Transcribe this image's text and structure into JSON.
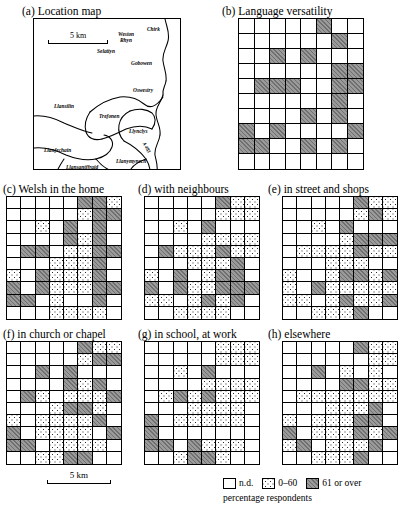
{
  "figure": {
    "scale_bar_label": "5 km",
    "bottom_scale_label": "5 km"
  },
  "legend": {
    "caption": "percentage respondents",
    "items": [
      {
        "key": "nd",
        "label": "n.d.",
        "fill": "white",
        "color": "#ffffff"
      },
      {
        "key": "low",
        "label": "0–60",
        "fill": "dotted",
        "color": "#ffffff"
      },
      {
        "key": "high",
        "label": "61 or over",
        "fill": "gray",
        "color": "#9a9a9a"
      }
    ]
  },
  "location_map": {
    "title": "(a) Location map",
    "scale_label": "5 km",
    "places": [
      {
        "name": "Chirk",
        "x": 137,
        "y": 14
      },
      {
        "name": "Weston",
        "x": 114,
        "y": 18
      },
      {
        "name": "Rhyn",
        "x": 117,
        "y": 24
      },
      {
        "name": "Selattyn",
        "x": 96,
        "y": 41
      },
      {
        "name": "Gobowen",
        "x": 126,
        "y": 52
      },
      {
        "name": "Oswestry",
        "x": 128,
        "y": 80
      },
      {
        "name": "Llansilin",
        "x": 49,
        "y": 90
      },
      {
        "name": "Trefonen",
        "x": 92,
        "y": 98
      },
      {
        "name": "Llynclys",
        "x": 124,
        "y": 112
      },
      {
        "name": "A 483",
        "x": 136,
        "y": 128
      },
      {
        "name": "Llanfechain",
        "x": 42,
        "y": 135
      },
      {
        "name": "Llanymynech",
        "x": 110,
        "y": 145
      },
      {
        "name": "Llansantffraid",
        "x": 62,
        "y": 150
      }
    ]
  },
  "panels": [
    {
      "id": "b",
      "title": "(b) Language versatility",
      "cols": 8,
      "rows": 10,
      "cells": [
        [
          "nd",
          "nd",
          "nd",
          "nd",
          "nd",
          "high",
          "nd",
          "nd"
        ],
        [
          "nd",
          "nd",
          "nd",
          "nd",
          "nd",
          "nd",
          "high",
          "nd"
        ],
        [
          "nd",
          "nd",
          "high",
          "nd",
          "high",
          "nd",
          "nd",
          "nd"
        ],
        [
          "nd",
          "nd",
          "nd",
          "nd",
          "nd",
          "nd",
          "high",
          "high"
        ],
        [
          "nd",
          "high",
          "high",
          "high",
          "nd",
          "nd",
          "high",
          "high"
        ],
        [
          "nd",
          "nd",
          "nd",
          "nd",
          "nd",
          "nd",
          "high",
          "nd"
        ],
        [
          "nd",
          "nd",
          "nd",
          "nd",
          "high",
          "nd",
          "high",
          "nd"
        ],
        [
          "high",
          "nd",
          "high",
          "nd",
          "nd",
          "nd",
          "nd",
          "high"
        ],
        [
          "high",
          "high",
          "nd",
          "nd",
          "high",
          "nd",
          "high",
          "nd"
        ],
        [
          "nd",
          "nd",
          "nd",
          "nd",
          "nd",
          "nd",
          "nd",
          "nd"
        ]
      ]
    },
    {
      "id": "c",
      "title": "(c) Welsh in the home",
      "cols": 8,
      "rows": 10,
      "cells": [
        [
          "nd",
          "nd",
          "nd",
          "nd",
          "nd",
          "high",
          "high",
          "low"
        ],
        [
          "nd",
          "nd",
          "nd",
          "nd",
          "nd",
          "low",
          "high",
          "high"
        ],
        [
          "nd",
          "nd",
          "low",
          "nd",
          "high",
          "nd",
          "high",
          "nd"
        ],
        [
          "nd",
          "nd",
          "nd",
          "nd",
          "high",
          "low",
          "high",
          "nd"
        ],
        [
          "nd",
          "high",
          "high",
          "nd",
          "low",
          "low",
          "high",
          "high"
        ],
        [
          "nd",
          "nd",
          "nd",
          "low",
          "low",
          "low",
          "high",
          "nd"
        ],
        [
          "low",
          "nd",
          "high",
          "low",
          "low",
          "low",
          "high",
          "nd"
        ],
        [
          "high",
          "nd",
          "high",
          "low",
          "low",
          "low",
          "high",
          "high"
        ],
        [
          "high",
          "high",
          "nd",
          "low",
          "nd",
          "nd",
          "high",
          "nd"
        ],
        [
          "nd",
          "nd",
          "nd",
          "low",
          "low",
          "low",
          "low",
          "nd"
        ]
      ]
    },
    {
      "id": "d",
      "title": "(d) with neighbours",
      "cols": 8,
      "rows": 10,
      "cells": [
        [
          "nd",
          "nd",
          "nd",
          "nd",
          "nd",
          "high",
          "low",
          "low"
        ],
        [
          "nd",
          "nd",
          "nd",
          "nd",
          "nd",
          "low",
          "low",
          "low"
        ],
        [
          "nd",
          "nd",
          "low",
          "nd",
          "high",
          "nd",
          "nd",
          "nd"
        ],
        [
          "nd",
          "nd",
          "nd",
          "nd",
          "low",
          "low",
          "low",
          "low"
        ],
        [
          "nd",
          "high",
          "low",
          "low",
          "low",
          "high",
          "low",
          "low"
        ],
        [
          "nd",
          "nd",
          "nd",
          "low",
          "low",
          "low",
          "high",
          "nd"
        ],
        [
          "low",
          "nd",
          "high",
          "nd",
          "low",
          "high",
          "high",
          "nd"
        ],
        [
          "high",
          "nd",
          "high",
          "low",
          "low",
          "high",
          "high",
          "high"
        ],
        [
          "low",
          "low",
          "nd",
          "low",
          "high",
          "low",
          "high",
          "nd"
        ],
        [
          "nd",
          "nd",
          "low",
          "low",
          "low",
          "low",
          "nd",
          "nd"
        ]
      ]
    },
    {
      "id": "e",
      "title": "(e) in street and shops",
      "cols": 8,
      "rows": 10,
      "cells": [
        [
          "nd",
          "nd",
          "nd",
          "nd",
          "nd",
          "high",
          "low",
          "low"
        ],
        [
          "nd",
          "nd",
          "nd",
          "nd",
          "nd",
          "low",
          "high",
          "low"
        ],
        [
          "nd",
          "nd",
          "low",
          "nd",
          "high",
          "nd",
          "nd",
          "nd"
        ],
        [
          "nd",
          "nd",
          "nd",
          "nd",
          "low",
          "high",
          "high",
          "high"
        ],
        [
          "nd",
          "low",
          "low",
          "low",
          "low",
          "high",
          "low",
          "low"
        ],
        [
          "nd",
          "nd",
          "nd",
          "low",
          "low",
          "low",
          "nd",
          "nd"
        ],
        [
          "low",
          "nd",
          "nd",
          "low",
          "high",
          "high",
          "low",
          "high"
        ],
        [
          "low",
          "nd",
          "high",
          "low",
          "low",
          "low",
          "low",
          "low"
        ],
        [
          "low",
          "low",
          "nd",
          "low",
          "high",
          "low",
          "low",
          "high"
        ],
        [
          "nd",
          "nd",
          "low",
          "low",
          "low",
          "high",
          "nd",
          "nd"
        ]
      ]
    },
    {
      "id": "f",
      "title": "(f) in church or chapel",
      "cols": 8,
      "rows": 10,
      "cells": [
        [
          "nd",
          "nd",
          "nd",
          "nd",
          "nd",
          "high",
          "low",
          "low"
        ],
        [
          "nd",
          "nd",
          "nd",
          "nd",
          "nd",
          "low",
          "high",
          "high"
        ],
        [
          "nd",
          "nd",
          "high",
          "nd",
          "high",
          "nd",
          "nd",
          "nd"
        ],
        [
          "nd",
          "nd",
          "nd",
          "nd",
          "high",
          "low",
          "high",
          "nd"
        ],
        [
          "nd",
          "high",
          "low",
          "nd",
          "low",
          "low",
          "low",
          "high"
        ],
        [
          "nd",
          "nd",
          "nd",
          "low",
          "high",
          "high",
          "low",
          "nd"
        ],
        [
          "low",
          "nd",
          "low",
          "low",
          "low",
          "low",
          "high",
          "nd"
        ],
        [
          "high",
          "nd",
          "low",
          "low",
          "low",
          "low",
          "nd",
          "high"
        ],
        [
          "high",
          "high",
          "nd",
          "low",
          "low",
          "low",
          "low",
          "nd"
        ],
        [
          "nd",
          "nd",
          "low",
          "low",
          "high",
          "high",
          "nd",
          "nd"
        ]
      ]
    },
    {
      "id": "g",
      "title": "(g) in school, at work",
      "cols": 8,
      "rows": 10,
      "cells": [
        [
          "nd",
          "nd",
          "nd",
          "nd",
          "nd",
          "low",
          "low",
          "low"
        ],
        [
          "nd",
          "nd",
          "nd",
          "nd",
          "nd",
          "low",
          "low",
          "low"
        ],
        [
          "nd",
          "nd",
          "low",
          "nd",
          "high",
          "nd",
          "nd",
          "nd"
        ],
        [
          "nd",
          "nd",
          "nd",
          "nd",
          "low",
          "low",
          "low",
          "low"
        ],
        [
          "nd",
          "low",
          "high",
          "low",
          "high",
          "low",
          "low",
          "low"
        ],
        [
          "nd",
          "nd",
          "nd",
          "low",
          "low",
          "low",
          "low",
          "nd"
        ],
        [
          "high",
          "nd",
          "low",
          "low",
          "low",
          "low",
          "low",
          "nd"
        ],
        [
          "high",
          "nd",
          "nd",
          "nd",
          "nd",
          "nd",
          "nd",
          "nd"
        ],
        [
          "high",
          "high",
          "nd",
          "high",
          "low",
          "low",
          "low",
          "nd"
        ],
        [
          "nd",
          "nd",
          "low",
          "high",
          "high",
          "low",
          "nd",
          "nd"
        ]
      ]
    },
    {
      "id": "h",
      "title": "(h) elsewhere",
      "cols": 8,
      "rows": 10,
      "cells": [
        [
          "nd",
          "nd",
          "nd",
          "nd",
          "nd",
          "high",
          "low",
          "low"
        ],
        [
          "nd",
          "nd",
          "nd",
          "nd",
          "nd",
          "nd",
          "low",
          "low"
        ],
        [
          "nd",
          "nd",
          "high",
          "nd",
          "low",
          "nd",
          "low",
          "nd"
        ],
        [
          "nd",
          "nd",
          "nd",
          "nd",
          "high",
          "high",
          "low",
          "low"
        ],
        [
          "nd",
          "low",
          "low",
          "low",
          "low",
          "low",
          "low",
          "low"
        ],
        [
          "nd",
          "nd",
          "nd",
          "low",
          "low",
          "low",
          "high",
          "nd"
        ],
        [
          "low",
          "nd",
          "low",
          "low",
          "low",
          "high",
          "high",
          "nd"
        ],
        [
          "high",
          "nd",
          "low",
          "low",
          "low",
          "high",
          "low",
          "high"
        ],
        [
          "low",
          "high",
          "nd",
          "low",
          "low",
          "low",
          "high",
          "nd"
        ],
        [
          "nd",
          "nd",
          "low",
          "low",
          "low",
          "high",
          "nd",
          "nd"
        ]
      ]
    }
  ]
}
